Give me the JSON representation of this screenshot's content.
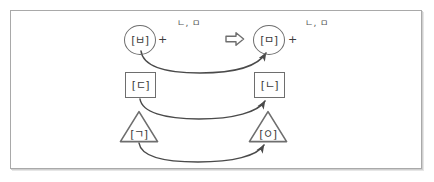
{
  "figure": {
    "border_color": "#a9a9a9",
    "background": "#ffffff",
    "stroke_color": "#6e6e6e",
    "glyph_color": "#3b3b3b",
    "label_color": "#555555"
  },
  "nodes": {
    "left_circle": {
      "glyph": "[ㅂ]",
      "shape": "circle"
    },
    "right_circle": {
      "glyph": "[ㅁ]",
      "shape": "circle"
    },
    "left_square": {
      "glyph": "[ㄷ]",
      "shape": "square"
    },
    "right_square": {
      "glyph": "[ㄴ]",
      "shape": "square"
    },
    "left_triangle": {
      "glyph": "[ㄱ]",
      "shape": "triangle"
    },
    "right_triangle": {
      "glyph": "[ㅇ]",
      "shape": "triangle"
    }
  },
  "operators": {
    "left_plus": "+",
    "right_plus": "+",
    "transform_arrow": "block-right-arrow"
  },
  "labels": {
    "left_side_label": "ㄴ, ㅁ",
    "right_side_label": "ㄴ, ㅁ"
  },
  "mappings": [
    {
      "from": "[ㅂ]",
      "to": "[ㅁ]",
      "style": "curved-arrow"
    },
    {
      "from": "[ㄷ]",
      "to": "[ㄴ]",
      "style": "curved-arrow"
    },
    {
      "from": "[ㄱ]",
      "to": "[ㅇ]",
      "style": "curved-arrow"
    }
  ]
}
